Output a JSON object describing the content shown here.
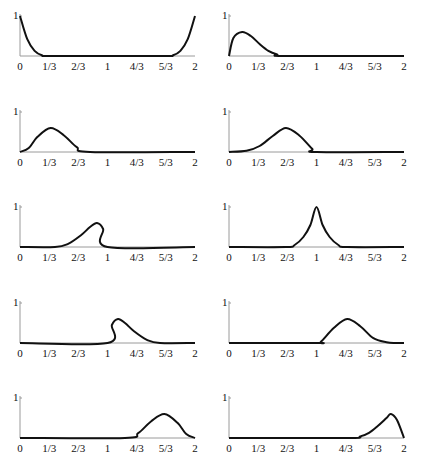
{
  "figure": {
    "background": "#ffffff",
    "curve_color": "#111111",
    "axis_color": "#9a9a9a"
  },
  "chart_data": {
    "type": "line",
    "layout": "grid 5 rows x 2 columns of small line plots",
    "shared_x_ticks": [
      "0",
      "1/3",
      "2/3",
      "1",
      "4/3",
      "5/3",
      "2"
    ],
    "shared_x_tick_values": [
      0,
      0.3333,
      0.6667,
      1,
      1.3333,
      1.6667,
      2
    ],
    "shared_y_ticks": [
      "1"
    ],
    "xlim": [
      0,
      2
    ],
    "ylim": [
      0,
      1
    ],
    "grid": false,
    "legend": null,
    "panels": [
      {
        "id": 1,
        "row": 1,
        "col": 1,
        "description": "decays from 1 at x=0 to 0 near x=1/3; rises from 0 near x=5/3 to 1 at x=2",
        "peak_x": [
          0,
          2
        ],
        "peak_y": 1.0,
        "x": [
          0,
          0.083,
          0.167,
          0.25,
          0.333,
          1.0,
          1.667,
          1.75,
          1.833,
          1.917,
          2.0
        ],
        "y": [
          1.0,
          0.42,
          0.13,
          0.02,
          0.0,
          0.0,
          0.0,
          0.02,
          0.13,
          0.42,
          1.0
        ]
      },
      {
        "id": 2,
        "row": 1,
        "col": 2,
        "description": "rises from 0 at x=0 to peak ~0.6 near x=0.15, decays to 0 by x~0.6",
        "peak_x": 0.15,
        "peak_y": 0.6,
        "x": [
          0,
          0.05,
          0.15,
          0.25,
          0.35,
          0.45,
          0.55,
          0.65,
          2.0
        ],
        "y": [
          0.0,
          0.45,
          0.6,
          0.5,
          0.3,
          0.13,
          0.04,
          0.0,
          0.0
        ]
      },
      {
        "id": 3,
        "row": 2,
        "col": 1,
        "description": "bump starting at 0, peak ~0.6 near x=0.35, zero after ~0.8",
        "peak_x": 0.35,
        "peak_y": 0.6,
        "x": [
          0,
          0.1,
          0.2,
          0.35,
          0.5,
          0.65,
          0.8,
          2.0
        ],
        "y": [
          0.0,
          0.1,
          0.38,
          0.6,
          0.42,
          0.12,
          0.0,
          0.0
        ]
      },
      {
        "id": 4,
        "row": 2,
        "col": 2,
        "description": "bump from ~0.1 to 1, peak ~0.6 near x=0.65",
        "peak_x": 0.65,
        "peak_y": 0.6,
        "x": [
          0,
          0.2,
          0.35,
          0.5,
          0.65,
          0.8,
          0.95,
          1.0,
          2.0
        ],
        "y": [
          0.0,
          0.03,
          0.15,
          0.4,
          0.6,
          0.42,
          0.08,
          0.0,
          0.0
        ]
      },
      {
        "id": 5,
        "row": 3,
        "col": 1,
        "description": "rises from ~0.4 to peak ~0.6 near x=0.88, drops sharply to 0 at x=1",
        "peak_x": 0.88,
        "peak_y": 0.6,
        "x": [
          0,
          0.4,
          0.55,
          0.7,
          0.8,
          0.88,
          0.95,
          1.0,
          2.0
        ],
        "y": [
          0.0,
          0.0,
          0.08,
          0.3,
          0.5,
          0.6,
          0.45,
          0.0,
          0.0
        ]
      },
      {
        "id": 6,
        "row": 3,
        "col": 2,
        "description": "symmetric cusp peak reaching 1 at x=1, support ~[0.65, 1.35]",
        "peak_x": 1.0,
        "peak_y": 1.0,
        "x": [
          0,
          0.65,
          0.75,
          0.85,
          0.93,
          1.0,
          1.07,
          1.15,
          1.25,
          1.35,
          2.0
        ],
        "y": [
          0.0,
          0.0,
          0.05,
          0.25,
          0.55,
          1.0,
          0.55,
          0.25,
          0.05,
          0.0,
          0.0
        ]
      },
      {
        "id": 7,
        "row": 4,
        "col": 1,
        "description": "rises sharply from 0 at x=1 to peak ~0.6 near x=1.12, decays to 0 by ~1.6",
        "peak_x": 1.12,
        "peak_y": 0.6,
        "x": [
          0,
          1.0,
          1.05,
          1.12,
          1.2,
          1.3,
          1.45,
          1.6,
          2.0
        ],
        "y": [
          0.0,
          0.0,
          0.45,
          0.6,
          0.5,
          0.3,
          0.08,
          0.0,
          0.0
        ]
      },
      {
        "id": 8,
        "row": 4,
        "col": 2,
        "description": "bump from 1 to ~1.9, peak ~0.6 near x=1.35",
        "peak_x": 1.35,
        "peak_y": 0.6,
        "x": [
          0,
          1.0,
          1.05,
          1.2,
          1.35,
          1.5,
          1.65,
          1.8,
          1.9,
          2.0
        ],
        "y": [
          0.0,
          0.0,
          0.03,
          0.38,
          0.6,
          0.42,
          0.12,
          0.02,
          0.0,
          0.0
        ]
      },
      {
        "id": 9,
        "row": 5,
        "col": 1,
        "description": "bump from ~1.2 to 2, peak ~0.6 near x=1.65",
        "peak_x": 1.65,
        "peak_y": 0.6,
        "x": [
          0,
          1.2,
          1.35,
          1.5,
          1.65,
          1.8,
          1.9,
          2.0
        ],
        "y": [
          0.0,
          0.0,
          0.12,
          0.42,
          0.6,
          0.38,
          0.1,
          0.0
        ]
      },
      {
        "id": 10,
        "row": 5,
        "col": 2,
        "description": "rises from ~1.4 to peak ~0.6 near x=1.85, falls to 0 at x=2",
        "peak_x": 1.85,
        "peak_y": 0.6,
        "x": [
          0,
          1.35,
          1.5,
          1.6,
          1.7,
          1.8,
          1.85,
          1.92,
          2.0
        ],
        "y": [
          0.0,
          0.0,
          0.04,
          0.13,
          0.3,
          0.5,
          0.6,
          0.45,
          0.0
        ]
      }
    ]
  }
}
